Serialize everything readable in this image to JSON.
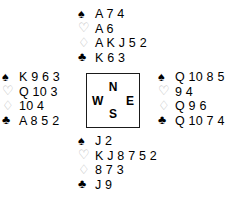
{
  "diagram": {
    "background_color": "#ffffff",
    "text_color": "#000000",
    "outline_suit_color": "#b9b9b9"
  },
  "suits": {
    "spade": {
      "name": "spade-suit-symbol",
      "glyph": "♠",
      "fill": "black"
    },
    "heart": {
      "name": "heart-suit-symbol",
      "glyph": "♡",
      "fill": "white"
    },
    "diamond": {
      "name": "diamond-suit-symbol",
      "glyph": "♢",
      "fill": "white"
    },
    "club": {
      "name": "club-suit-symbol",
      "glyph": "♣",
      "fill": "black"
    }
  },
  "hands": {
    "north": {
      "position_label": "North",
      "spades": "A 7 4",
      "hearts": "A 6",
      "diamonds": "A K J 5 2",
      "clubs": "K 6 3"
    },
    "west": {
      "position_label": "West",
      "spades": "K 9 6 3",
      "hearts": "Q 10 3",
      "diamonds": "10 4",
      "clubs": "A 8 5 2"
    },
    "east": {
      "position_label": "East",
      "spades": "Q 10 8 5",
      "hearts": "9 4",
      "diamonds": "Q 9 6",
      "clubs": "Q 10 7 4"
    },
    "south": {
      "position_label": "South",
      "spades": "J 2",
      "hearts": "K J 8 7 5 2",
      "diamonds": "8 7 3",
      "clubs": "J 9"
    }
  },
  "compass": {
    "north": "N",
    "west": "W",
    "east": "E",
    "south": "S"
  }
}
